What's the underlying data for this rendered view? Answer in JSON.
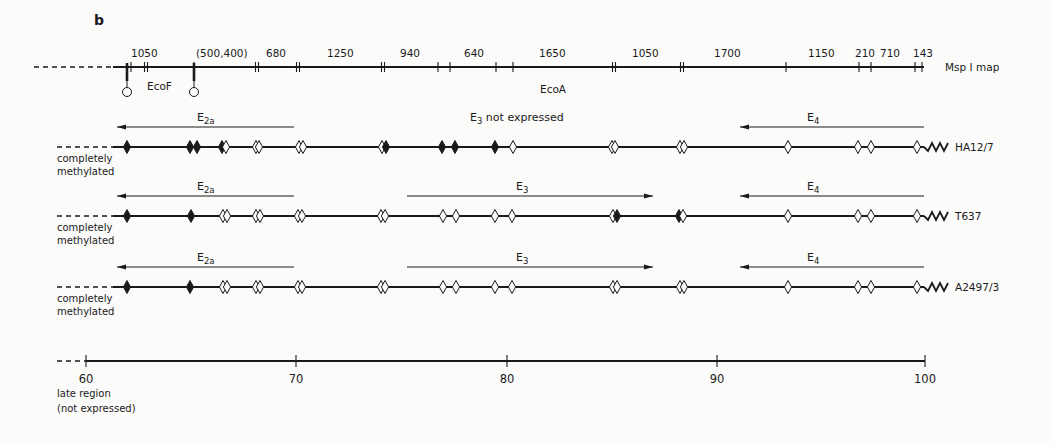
{
  "panel_label": "b",
  "msp_map": {
    "label": "Msp I map",
    "y": 67,
    "x_start": 113,
    "x_end": 924,
    "dash_start": 34,
    "fragment_sizes": [
      {
        "text": "1050",
        "x": 131
      },
      {
        "text": "(500,400)",
        "x": 196
      },
      {
        "text": "680",
        "x": 266
      },
      {
        "text": "1250",
        "x": 327
      },
      {
        "text": "940",
        "x": 400
      },
      {
        "text": "640",
        "x": 464
      },
      {
        "text": "1650",
        "x": 539
      },
      {
        "text": "1050",
        "x": 632
      },
      {
        "text": "1700",
        "x": 714
      },
      {
        "text": "1150",
        "x": 808
      },
      {
        "text": "210",
        "x": 855
      },
      {
        "text": "710",
        "x": 880
      },
      {
        "text": "143",
        "x": 913
      }
    ],
    "single_ticks": [
      131,
      194,
      438,
      450,
      496,
      513,
      786,
      859,
      871,
      915,
      922
    ],
    "double_ticks": [
      146,
      257,
      298,
      383,
      614,
      682
    ],
    "ecoF": {
      "label": "EcoF",
      "sites": [
        127,
        194
      ],
      "label_x": 147,
      "label_y": 90
    },
    "ecoA": {
      "label": "EcoA",
      "x": 540,
      "y": 93
    }
  },
  "rows": [
    {
      "cell_line": "HA12/7",
      "y": 147,
      "methylation_note": [
        "completely",
        "methylated"
      ],
      "arrows": [
        {
          "gene": "E",
          "sub": "2a",
          "from": 294,
          "to": 117,
          "label_x": 197
        },
        {
          "gene": "E",
          "sub": "4",
          "from": 924,
          "to": 740,
          "label_x": 807
        }
      ],
      "center_text": {
        "gene": "E",
        "sub": "3",
        "rest": " not expressed",
        "x": 470
      },
      "sites": [
        {
          "x": 127,
          "type": "filled"
        },
        {
          "x": 190,
          "type": "filled"
        },
        {
          "x": 197,
          "type": "filled"
        },
        {
          "x": 222,
          "type": "filled"
        },
        {
          "x": 226,
          "type": "open"
        },
        {
          "x": 256,
          "type": "open"
        },
        {
          "x": 259,
          "type": "open"
        },
        {
          "x": 299,
          "type": "open"
        },
        {
          "x": 303,
          "type": "open"
        },
        {
          "x": 382,
          "type": "open"
        },
        {
          "x": 386,
          "type": "filled"
        },
        {
          "x": 442,
          "type": "filled"
        },
        {
          "x": 455,
          "type": "filled"
        },
        {
          "x": 495,
          "type": "filled"
        },
        {
          "x": 513,
          "type": "open"
        },
        {
          "x": 612,
          "type": "open"
        },
        {
          "x": 615,
          "type": "open"
        },
        {
          "x": 680,
          "type": "open"
        },
        {
          "x": 684,
          "type": "open"
        },
        {
          "x": 788,
          "type": "open"
        },
        {
          "x": 858,
          "type": "open"
        },
        {
          "x": 871,
          "type": "open"
        },
        {
          "x": 917,
          "type": "open"
        }
      ]
    },
    {
      "cell_line": "T637",
      "y": 216,
      "methylation_note": [
        "completely",
        "methylated"
      ],
      "arrows": [
        {
          "gene": "E",
          "sub": "2a",
          "from": 294,
          "to": 117,
          "label_x": 197
        },
        {
          "gene": "E",
          "sub": "3",
          "from": 407,
          "to": 653,
          "label_x": 516
        },
        {
          "gene": "E",
          "sub": "4",
          "from": 924,
          "to": 740,
          "label_x": 807
        }
      ],
      "sites": [
        {
          "x": 127,
          "type": "filled"
        },
        {
          "x": 191,
          "type": "filled"
        },
        {
          "x": 223,
          "type": "open"
        },
        {
          "x": 227,
          "type": "open"
        },
        {
          "x": 256,
          "type": "open"
        },
        {
          "x": 260,
          "type": "open"
        },
        {
          "x": 298,
          "type": "open"
        },
        {
          "x": 302,
          "type": "open"
        },
        {
          "x": 381,
          "type": "open"
        },
        {
          "x": 385,
          "type": "open"
        },
        {
          "x": 443,
          "type": "open"
        },
        {
          "x": 456,
          "type": "open"
        },
        {
          "x": 495,
          "type": "open"
        },
        {
          "x": 512,
          "type": "open"
        },
        {
          "x": 613,
          "type": "open"
        },
        {
          "x": 617,
          "type": "filled"
        },
        {
          "x": 679,
          "type": "filled"
        },
        {
          "x": 683,
          "type": "open"
        },
        {
          "x": 788,
          "type": "open"
        },
        {
          "x": 858,
          "type": "open"
        },
        {
          "x": 871,
          "type": "open"
        },
        {
          "x": 917,
          "type": "open"
        }
      ]
    },
    {
      "cell_line": "A2497/3",
      "y": 287,
      "methylation_note": [
        "completely",
        "methylated"
      ],
      "arrows": [
        {
          "gene": "E",
          "sub": "2a",
          "from": 294,
          "to": 117,
          "label_x": 197
        },
        {
          "gene": "E",
          "sub": "3",
          "from": 407,
          "to": 653,
          "label_x": 516
        },
        {
          "gene": "E",
          "sub": "4",
          "from": 924,
          "to": 740,
          "label_x": 807
        }
      ],
      "sites": [
        {
          "x": 127,
          "type": "filled"
        },
        {
          "x": 190,
          "type": "filled"
        },
        {
          "x": 223,
          "type": "open"
        },
        {
          "x": 227,
          "type": "open"
        },
        {
          "x": 256,
          "type": "open"
        },
        {
          "x": 260,
          "type": "open"
        },
        {
          "x": 298,
          "type": "open"
        },
        {
          "x": 302,
          "type": "open"
        },
        {
          "x": 381,
          "type": "open"
        },
        {
          "x": 385,
          "type": "open"
        },
        {
          "x": 443,
          "type": "open"
        },
        {
          "x": 456,
          "type": "open"
        },
        {
          "x": 495,
          "type": "open"
        },
        {
          "x": 512,
          "type": "open"
        },
        {
          "x": 613,
          "type": "open"
        },
        {
          "x": 617,
          "type": "open"
        },
        {
          "x": 680,
          "type": "open"
        },
        {
          "x": 684,
          "type": "open"
        },
        {
          "x": 788,
          "type": "open"
        },
        {
          "x": 858,
          "type": "open"
        },
        {
          "x": 871,
          "type": "open"
        },
        {
          "x": 917,
          "type": "open"
        }
      ]
    }
  ],
  "row_line": {
    "x_start": 113,
    "x_end": 924,
    "dash_start": 57
  },
  "scale_axis": {
    "y": 361,
    "ticks": [
      {
        "value": "60",
        "x": 86
      },
      {
        "value": "70",
        "x": 296
      },
      {
        "value": "80",
        "x": 507
      },
      {
        "value": "90",
        "x": 717
      },
      {
        "value": "100",
        "x": 925
      }
    ],
    "dash_start": 57,
    "region_note": [
      "late region",
      "(not expressed)"
    ]
  }
}
